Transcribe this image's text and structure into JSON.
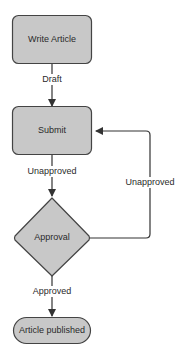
{
  "diagram": {
    "type": "flowchart",
    "colors": {
      "node_fill": "#c8c8c8",
      "node_stroke": "#444444",
      "edge": "#333333",
      "text": "#2a2a2a"
    },
    "nodes": {
      "write_article": {
        "label": "Write Article",
        "shape": "rounded-rectangle"
      },
      "submit": {
        "label": "Submit",
        "shape": "rounded-rectangle"
      },
      "approval": {
        "label": "Approval",
        "shape": "diamond"
      },
      "published": {
        "label": "Article published",
        "shape": "pill"
      }
    },
    "edges": {
      "draft": {
        "from": "write_article",
        "to": "submit",
        "label": "Draft"
      },
      "to_approval": {
        "from": "submit",
        "to": "approval",
        "label": "Unapproved"
      },
      "loop_back": {
        "from": "approval",
        "to": "submit",
        "label": "Unapproved"
      },
      "approved": {
        "from": "approval",
        "to": "published",
        "label": "Approved"
      }
    }
  }
}
